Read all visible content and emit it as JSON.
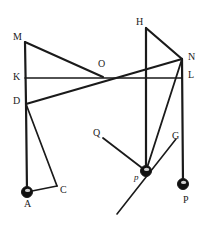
{
  "figure": {
    "width": 211,
    "height": 226,
    "background": "#ffffff",
    "stroke_color": "#1a1a1a",
    "label_color": "#1a1a1a",
    "ball_fill": "#101010",
    "ball_highlight": "#f2f2f2"
  },
  "labels": [
    {
      "id": "label-M",
      "text": "M",
      "x": 13,
      "y": 32
    },
    {
      "id": "label-K",
      "text": "K",
      "x": 13,
      "y": 72
    },
    {
      "id": "label-D",
      "text": "D",
      "x": 13,
      "y": 96
    },
    {
      "id": "label-A",
      "text": "A",
      "x": 24,
      "y": 199
    },
    {
      "id": "label-C",
      "text": "C",
      "x": 60,
      "y": 185
    },
    {
      "id": "label-O",
      "text": "O",
      "x": 98,
      "y": 59
    },
    {
      "id": "label-H",
      "text": "H",
      "x": 136,
      "y": 17
    },
    {
      "id": "label-N",
      "text": "N",
      "x": 188,
      "y": 52
    },
    {
      "id": "label-L",
      "text": "L",
      "x": 188,
      "y": 70
    },
    {
      "id": "label-Q",
      "text": "Q",
      "x": 93,
      "y": 128
    },
    {
      "id": "label-G",
      "text": "G",
      "x": 172,
      "y": 131
    },
    {
      "id": "label-p",
      "text": "p",
      "x": 134,
      "y": 173,
      "italic": true
    },
    {
      "id": "label-P",
      "text": "P",
      "x": 183,
      "y": 195
    }
  ],
  "points": {
    "M": {
      "x": 25,
      "y": 42
    },
    "K": {
      "x": 25,
      "y": 78
    },
    "D": {
      "x": 26,
      "y": 104
    },
    "A": {
      "x": 27,
      "y": 192
    },
    "C": {
      "x": 57,
      "y": 186
    },
    "O": {
      "x": 103,
      "y": 77
    },
    "H": {
      "x": 146,
      "y": 28
    },
    "N": {
      "x": 182,
      "y": 59
    },
    "L": {
      "x": 182,
      "y": 78
    },
    "G": {
      "x": 176,
      "y": 139
    },
    "Q": {
      "x": 103,
      "y": 138
    },
    "p": {
      "x": 146,
      "y": 171
    },
    "P": {
      "x": 183,
      "y": 184
    },
    "diag_end": {
      "x": 117,
      "y": 214
    }
  },
  "segments": [
    {
      "name": "bar-M-K-D",
      "from": "M",
      "to": "D",
      "width": 2.2
    },
    {
      "name": "bar-D-A",
      "from": "D",
      "to": "A",
      "width": 2.2
    },
    {
      "name": "bar-D-C",
      "from": "D",
      "to": "C",
      "width": 1.7
    },
    {
      "name": "bar-A-C",
      "from": "A",
      "to": "C",
      "width": 1.7
    },
    {
      "name": "bar-M-O",
      "from": "M",
      "to": "O",
      "width": 2.0
    },
    {
      "name": "bar-K-L",
      "from": "K",
      "to": "L",
      "width": 1.6
    },
    {
      "name": "bar-D-O-N",
      "from": "D",
      "to": "N",
      "width": 2.2
    },
    {
      "name": "bar-H-p",
      "from": "H",
      "to": "p",
      "width": 2.2
    },
    {
      "name": "bar-H-N",
      "from": "H",
      "to": "N",
      "width": 2.2
    },
    {
      "name": "bar-N-L-P",
      "from": "N",
      "to": "P",
      "width": 2.2
    },
    {
      "name": "bar-N-p",
      "from": "N",
      "to": "p",
      "width": 1.8
    },
    {
      "name": "bar-Q-p",
      "from": "Q",
      "to": "p",
      "width": 1.8
    },
    {
      "name": "bar-diag-G",
      "from": "diag_end",
      "to": "G",
      "width": 1.6
    }
  ],
  "balls": [
    {
      "name": "ball-A",
      "at": "A",
      "r": 5.5
    },
    {
      "name": "ball-p",
      "at": "p",
      "r": 5.5
    },
    {
      "name": "ball-P",
      "at": "P",
      "r": 5.5
    }
  ]
}
